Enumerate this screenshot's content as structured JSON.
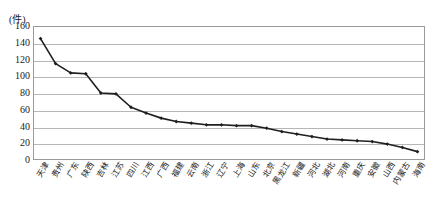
{
  "chart_data": {
    "type": "line",
    "title": "",
    "xlabel": "",
    "ylabel": "(件)",
    "unit_label": "(件)",
    "ylim": [
      0,
      160
    ],
    "ytick_step": 20,
    "yticks": [
      160,
      140,
      120,
      100,
      80,
      60,
      40,
      20,
      0
    ],
    "grid": true,
    "legend": "none",
    "marker": "filled-diamond",
    "line_color": "#1f1f1f",
    "grid_color": "#b6b6b6",
    "categories": [
      "天津",
      "贵州",
      "广东",
      "陕西",
      "吉林",
      "江苏",
      "四川",
      "江西",
      "广西",
      "福建",
      "云南",
      "浙江",
      "辽宁",
      "上海",
      "山东",
      "北京",
      "黑龙江",
      "新疆",
      "河北",
      "湖北",
      "河南",
      "重庆",
      "安徽",
      "山西",
      "内蒙古",
      "海南"
    ],
    "values": [
      145,
      115,
      104,
      103,
      80,
      79,
      63,
      56,
      50,
      46,
      44,
      42,
      42,
      41,
      41,
      38,
      34,
      31,
      28,
      25,
      24,
      23,
      22,
      19,
      15,
      10
    ],
    "series": [
      {
        "name": "件数",
        "values": [
          145,
          115,
          104,
          103,
          80,
          79,
          63,
          56,
          50,
          46,
          44,
          42,
          42,
          41,
          41,
          38,
          34,
          31,
          28,
          25,
          24,
          23,
          22,
          19,
          15,
          10
        ]
      }
    ]
  }
}
